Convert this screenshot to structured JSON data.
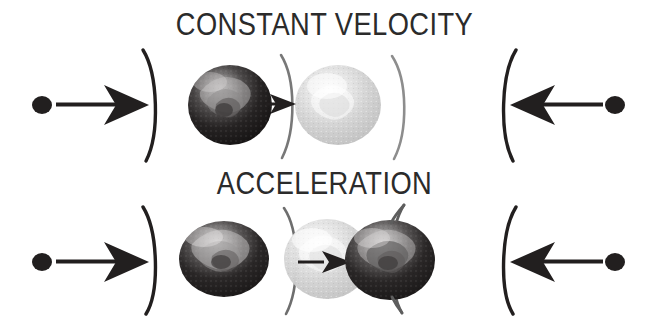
{
  "figure": {
    "width": 649,
    "height": 317,
    "background_color": "#ffffff"
  },
  "panels": [
    {
      "id": "constant-velocity",
      "title": "CONSTANT VELOCITY",
      "title_color": "#2b2b2b",
      "row_center_y": 105,
      "left_marker": {
        "dot": {
          "cx": 42,
          "cy": 105,
          "rx": 10,
          "ry": 9,
          "color": "#221f1f"
        },
        "arrow": {
          "x1": 56,
          "y1": 105,
          "x2": 143,
          "y2": 105,
          "direction": "right",
          "color": "#221f1f"
        },
        "bracket": {
          "glyph": ")",
          "x": 148,
          "color": "#221f1f"
        }
      },
      "spheres": [
        {
          "name": "dark-sphere-left",
          "cx": 230,
          "cy": 105,
          "rx": 42,
          "ry": 40,
          "shade": "dark",
          "base_color": "#1c1a1a",
          "highlight_color": "#8f8d8d"
        },
        {
          "name": "light-sphere-right",
          "cx": 338,
          "cy": 105,
          "rx": 43,
          "ry": 40,
          "shade": "light",
          "base_color": "#c9c9c9",
          "highlight_color": "#efefef"
        }
      ],
      "inner_arrow": {
        "x1": 268,
        "y1": 104,
        "x2": 300,
        "y2": 104,
        "direction": "right",
        "color": "#221f1f",
        "size": "small"
      },
      "inner_brackets": [
        {
          "glyph": ")",
          "x": 287,
          "color": "#6e6e6e"
        },
        {
          "glyph": ")",
          "x": 398,
          "color": "#8a8a8a"
        }
      ],
      "right_marker": {
        "bracket": {
          "glyph": "(",
          "x": 512,
          "color": "#221f1f"
        },
        "arrow": {
          "x1": 604,
          "y1": 105,
          "x2": 518,
          "y2": 105,
          "direction": "left",
          "color": "#221f1f"
        },
        "dot": {
          "cx": 615,
          "cy": 105,
          "rx": 10,
          "ry": 9,
          "color": "#221f1f"
        }
      }
    },
    {
      "id": "acceleration",
      "title": "ACCELERATION",
      "title_color": "#2b2b2b",
      "row_center_y": 262,
      "left_marker": {
        "dot": {
          "cx": 42,
          "cy": 262,
          "rx": 10,
          "ry": 9,
          "color": "#221f1f"
        },
        "arrow": {
          "x1": 56,
          "y1": 262,
          "x2": 143,
          "y2": 262,
          "direction": "right",
          "color": "#221f1f"
        },
        "bracket": {
          "glyph": ")",
          "x": 148,
          "color": "#221f1f"
        }
      },
      "spheres": [
        {
          "name": "dark-sphere-left",
          "cx": 224,
          "cy": 259,
          "rx": 45,
          "ry": 38,
          "shade": "dark",
          "base_color": "#232020",
          "highlight_color": "#b4b2b2"
        },
        {
          "name": "light-sphere-middle",
          "cx": 327,
          "cy": 259,
          "rx": 43,
          "ry": 40,
          "shade": "light",
          "base_color": "#c6c6c6",
          "highlight_color": "#f0f0f0"
        },
        {
          "name": "dark-sphere-right",
          "cx": 390,
          "cy": 260,
          "rx": 45,
          "ry": 40,
          "shade": "dark",
          "base_color": "#1f1d1d",
          "highlight_color": "#aaa8a8"
        }
      ],
      "inner_arrow": {
        "x1": 300,
        "y1": 262,
        "x2": 348,
        "y2": 262,
        "direction": "right",
        "color": "#221f1f",
        "size": "small"
      },
      "inner_brackets": [
        {
          "glyph": ")",
          "x": 291,
          "color": "#6e6e6e"
        },
        {
          "glyph": ")",
          "x": 410,
          "color": "#5e5e5e"
        }
      ],
      "right_marker": {
        "bracket": {
          "glyph": "(",
          "x": 512,
          "color": "#221f1f"
        },
        "arrow": {
          "x1": 604,
          "y1": 262,
          "x2": 518,
          "y2": 262,
          "direction": "left",
          "color": "#221f1f"
        },
        "dot": {
          "cx": 615,
          "cy": 262,
          "rx": 10,
          "ry": 9,
          "color": "#221f1f"
        }
      }
    }
  ]
}
